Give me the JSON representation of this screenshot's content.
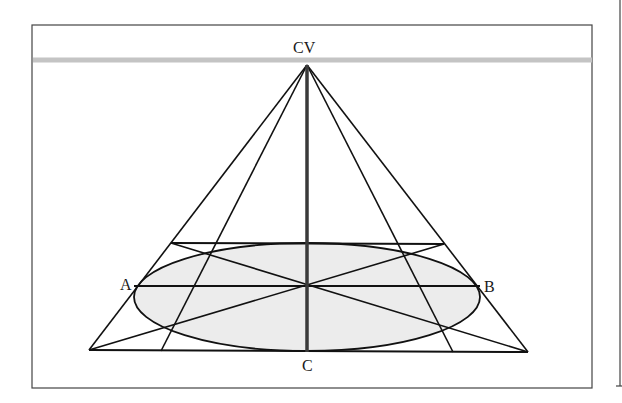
{
  "diagram": {
    "type": "perspective-construction",
    "labels": {
      "vanishing_point": "CV",
      "left_point": "A",
      "right_point": "B",
      "bottom_point": "C"
    },
    "colors": {
      "stroke": "#111111",
      "horizon": "#c4c4c4",
      "ellipse_fill": "#ececec",
      "frame": "#444444",
      "center_line": "#3a3a3a"
    },
    "geometry": {
      "frame": {
        "x": 32,
        "y": 25,
        "w": 560,
        "h": 363
      },
      "horizon_y": 60,
      "cv": [
        307,
        65
      ],
      "square": {
        "tl": [
          171,
          243
        ],
        "tr": [
          444,
          244
        ],
        "br": [
          528,
          352
        ],
        "bl": [
          89,
          350
        ]
      },
      "inner_bottom": [
        [
          161,
          351
        ],
        [
          453,
          352
        ]
      ],
      "ellipse": {
        "cx": 307,
        "cy": 297,
        "rx": 173,
        "ry": 54
      },
      "horizontal_ab_y": 286,
      "center_bottom": [
        307,
        352
      ]
    }
  }
}
